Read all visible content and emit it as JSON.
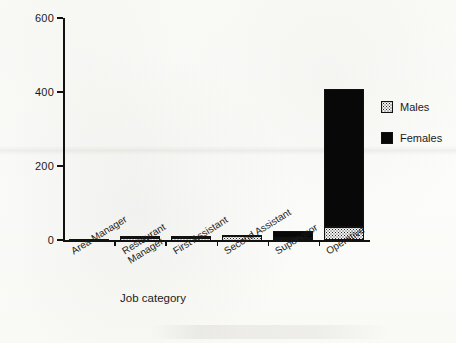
{
  "chart_data": {
    "type": "bar",
    "title": "",
    "subtitle": "",
    "xlabel": "Job category",
    "ylabel": "Gender of employees",
    "ylim": [
      0,
      600
    ],
    "yticks": [
      0,
      200,
      400,
      600
    ],
    "grid": false,
    "stacked": true,
    "legend_position": "right",
    "categories": [
      "Area Manager",
      "Restaurant\nManager",
      "First Assistant",
      "Second Assistant",
      "Supervisor",
      "Operative"
    ],
    "series": [
      {
        "name": "Males",
        "color": "#f2f2f0",
        "values": [
          3,
          9,
          10,
          12,
          6,
          35
        ]
      },
      {
        "name": "Females",
        "color": "#080808",
        "values": [
          0,
          1,
          1,
          2,
          18,
          373
        ]
      }
    ],
    "totals": [
      3,
      10,
      11,
      14,
      24,
      408
    ]
  },
  "legend": {
    "items": [
      {
        "label": "Males",
        "swatch": "stipple-swatch"
      },
      {
        "label": "Females",
        "swatch": "solid-black-swatch"
      }
    ]
  },
  "axis": {
    "y_tick_labels": [
      "600",
      "400",
      "200",
      "0"
    ],
    "y_label": "Gender of employees",
    "x_label": "Job category"
  }
}
